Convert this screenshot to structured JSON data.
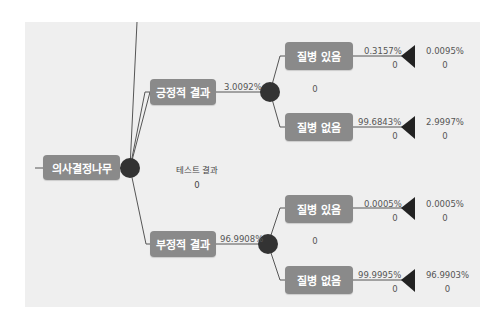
{
  "colors": {
    "panel_bg": "#efefef",
    "box_bg": "#8a8a8a",
    "box_text": "#ffffff",
    "node_fill": "#333333",
    "line": "#555555",
    "text": "#555555"
  },
  "root": {
    "label": "의사결정나무"
  },
  "chance_node": {
    "label": "테스트 결과",
    "value": "0"
  },
  "branches": [
    {
      "label": "긍정적 결과",
      "probability": "3.0092%",
      "node_value": "0",
      "leaves": [
        {
          "label": "질병 있음",
          "probability": "0.3157%",
          "payoff": "0",
          "joint_probability": "0.0095%",
          "joint_payoff": "0"
        },
        {
          "label": "질병 없음",
          "probability": "99.6843%",
          "payoff": "0",
          "joint_probability": "2.9997%",
          "joint_payoff": "0"
        }
      ]
    },
    {
      "label": "부정적 결과",
      "probability": "96.9908%",
      "node_value": "0",
      "leaves": [
        {
          "label": "질병 있음",
          "probability": "0.0005%",
          "payoff": "0",
          "joint_probability": "0.0005%",
          "joint_payoff": "0"
        },
        {
          "label": "질병 없음",
          "probability": "99.9995%",
          "payoff": "0",
          "joint_probability": "96.9903%",
          "joint_payoff": "0"
        }
      ]
    }
  ]
}
